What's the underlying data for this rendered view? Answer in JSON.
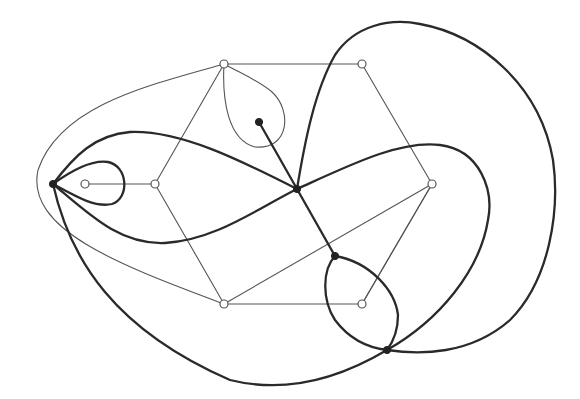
{
  "diagram": {
    "type": "plane graph with dual graph overlay",
    "colors": {
      "primal_edge": "#555555",
      "dual_edge": "#2a2a2a",
      "hollow_vertex_fill": "#ffffff",
      "solid_vertex_fill": "#222222",
      "background": "#ffffff"
    },
    "primal_vertices": [
      {
        "id": "a",
        "x": 224,
        "y": 64
      },
      {
        "id": "b",
        "x": 362,
        "y": 64
      },
      {
        "id": "c",
        "x": 432,
        "y": 184
      },
      {
        "id": "d",
        "x": 362,
        "y": 304
      },
      {
        "id": "e",
        "x": 224,
        "y": 304
      },
      {
        "id": "f",
        "x": 155,
        "y": 184
      },
      {
        "id": "g",
        "x": 85,
        "y": 184
      }
    ],
    "dual_vertices": [
      {
        "id": "L",
        "x": 53,
        "y": 184
      },
      {
        "id": "T",
        "x": 259,
        "y": 122
      },
      {
        "id": "C",
        "x": 297,
        "y": 189
      },
      {
        "id": "M",
        "x": 335,
        "y": 256
      },
      {
        "id": "B",
        "x": 387,
        "y": 350
      }
    ],
    "primal_edges": [
      [
        "a",
        "b"
      ],
      [
        "b",
        "c"
      ],
      [
        "c",
        "d"
      ],
      [
        "d",
        "e"
      ],
      [
        "e",
        "f"
      ],
      [
        "f",
        "a"
      ],
      [
        "f",
        "g"
      ],
      [
        "a",
        "e-outer"
      ],
      [
        "a",
        "loop"
      ],
      [
        "c",
        "e"
      ],
      [
        "a",
        "d-diag"
      ]
    ],
    "dual_edges": [
      [
        "L",
        "L-loop"
      ],
      [
        "L",
        "C-upper"
      ],
      [
        "L",
        "C-lower"
      ],
      [
        "L",
        "B"
      ],
      [
        "T",
        "C"
      ],
      [
        "C",
        "M"
      ],
      [
        "M",
        "B-left"
      ],
      [
        "M",
        "B-right"
      ],
      [
        "C",
        "B-outer"
      ],
      [
        "C",
        "B-inner"
      ]
    ]
  }
}
